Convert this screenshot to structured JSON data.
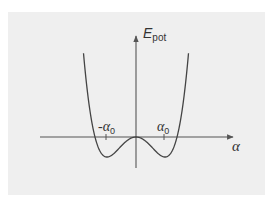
{
  "diagram": {
    "y_axis": {
      "label_main": "E",
      "label_sub": "pot"
    },
    "x_axis": {
      "label": "α"
    },
    "ticks": [
      {
        "label_sign": "-",
        "label_main": "α",
        "label_sub": "0",
        "position": "-α0"
      },
      {
        "label_sign": "",
        "label_main": "α",
        "label_sub": "0",
        "position": "α0"
      }
    ],
    "curve": {
      "description": "Quartic double-well: E(α) ∝ (α² − α0²)², with local maximum at α = 0 on the α-axis and minima at ±α0 below the axis",
      "minima_at": [
        "-α0",
        "α0"
      ],
      "local_max_at": "0"
    },
    "colors": {
      "background": "#efefef",
      "curve": "#444444",
      "axes": "#555555",
      "text": "#333333"
    }
  }
}
